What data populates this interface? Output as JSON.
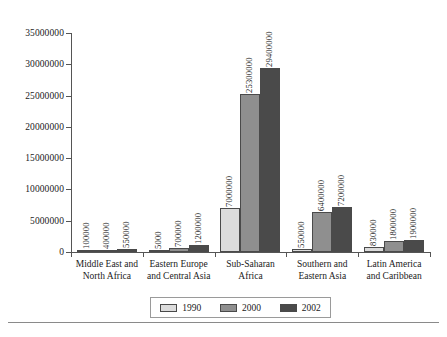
{
  "chart_data": {
    "type": "bar",
    "title": "",
    "subtitle": "",
    "xlabel": "",
    "ylabel": "",
    "grid": false,
    "legend_position": "bottom",
    "ylim": [
      0,
      35000000
    ],
    "yticks": [
      0,
      5000000,
      10000000,
      15000000,
      20000000,
      25000000,
      30000000,
      35000000
    ],
    "ytick_labels": [
      "0",
      "5000000",
      "10000000",
      "15000000",
      "20000000",
      "25000000",
      "30000000",
      "35000000"
    ],
    "categories": [
      "Middle East and North Africa",
      "Eastern Europe and Central Asia",
      "Sub-Saharan Africa",
      "Southern and Eastern Asia",
      "Latin America and Caribbean"
    ],
    "category_lines": [
      [
        "Middle East and",
        "North Africa"
      ],
      [
        "Eastern Europe",
        "and Central Asia"
      ],
      [
        "Sub-Saharan",
        "Africa"
      ],
      [
        "Southern and",
        "Eastern Asia"
      ],
      [
        "Latin America",
        "and Caribbean"
      ]
    ],
    "series": [
      {
        "name": "1990",
        "color": "#dcdcdc",
        "values": [
          100000,
          5000,
          7000000,
          550000,
          830000
        ],
        "value_labels": [
          "100000",
          "5000",
          "7000000",
          "550000",
          "830000"
        ]
      },
      {
        "name": "2000",
        "color": "#8f8f8f",
        "values": [
          400000,
          700000,
          25300000,
          6400000,
          1800000
        ],
        "value_labels": [
          "400000",
          "700000",
          "25300000",
          "6400000",
          "1800000"
        ]
      },
      {
        "name": "2002",
        "color": "#4a4a4a",
        "values": [
          550000,
          1200000,
          29400000,
          7200000,
          1900000
        ],
        "value_labels": [
          "550000",
          "1200000",
          "29400000",
          "7200000",
          "1900000"
        ]
      }
    ]
  },
  "legend": {
    "items": [
      {
        "label": "1990",
        "swatch": "legend-swatch-1990"
      },
      {
        "label": "2000",
        "swatch": "legend-swatch-2000"
      },
      {
        "label": "2002",
        "swatch": "legend-swatch-2002"
      }
    ]
  },
  "colors": {
    "series_1990": "#dcdcdc",
    "series_2000": "#8f8f8f",
    "series_2002": "#4a4a4a",
    "axis": "#555555",
    "text": "#1a1a1a",
    "legend_border": "#9a9a9a",
    "footer_rule": "#8a8a8a",
    "background": "#ffffff"
  }
}
